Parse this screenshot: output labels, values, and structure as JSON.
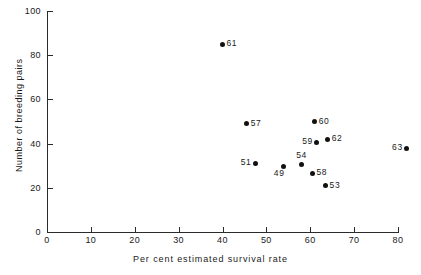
{
  "chart_data": {
    "type": "scatter",
    "title": "",
    "xlabel": "Per cent estimated survival rate",
    "ylabel": "Number of breeding pairs",
    "xlim": [
      0,
      80
    ],
    "ylim": [
      0,
      100
    ],
    "xticks": [
      0,
      10,
      20,
      30,
      40,
      50,
      60,
      70,
      80
    ],
    "yticks": [
      0,
      20,
      40,
      60,
      80,
      100
    ],
    "grid": false,
    "legend": null,
    "point_color": "#111111",
    "axis_color": "#2b2b2b",
    "points": [
      {
        "label": "61",
        "x": 40,
        "y": 85,
        "label_pos": "right"
      },
      {
        "label": "57",
        "x": 45.5,
        "y": 49,
        "label_pos": "right"
      },
      {
        "label": "60",
        "x": 61,
        "y": 50,
        "label_pos": "right"
      },
      {
        "label": "59",
        "x": 61.5,
        "y": 40.5,
        "label_pos": "left"
      },
      {
        "label": "62",
        "x": 64,
        "y": 42,
        "label_pos": "right"
      },
      {
        "label": "63",
        "x": 82,
        "y": 38,
        "label_pos": "left"
      },
      {
        "label": "51",
        "x": 47.5,
        "y": 31,
        "label_pos": "left"
      },
      {
        "label": "54",
        "x": 58,
        "y": 30.5,
        "label_pos": "above"
      },
      {
        "label": "49",
        "x": 54,
        "y": 29.5,
        "label_pos": "below-left"
      },
      {
        "label": "58",
        "x": 60.5,
        "y": 26.5,
        "label_pos": "right"
      },
      {
        "label": "53",
        "x": 63.5,
        "y": 21,
        "label_pos": "right"
      }
    ]
  }
}
